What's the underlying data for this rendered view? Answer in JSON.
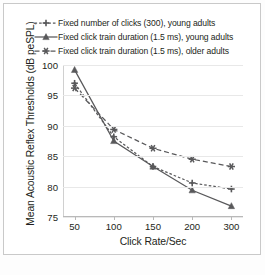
{
  "figure": {
    "background_color": "#ffffff",
    "frame_color": "#c9c9c9"
  },
  "axes": {
    "ytitle": "Mean Acoustic Reflex Thresholds (dB peSPL)",
    "xtitle": "Click Rate/Sec",
    "yticks": [
      "100",
      "95",
      "90",
      "85",
      "80",
      "75"
    ],
    "xticks": [
      "50",
      "100",
      "150",
      "200",
      "300"
    ]
  },
  "legend": {
    "position": "top-left-above-axes",
    "items": [
      {
        "label": "Fixed number of clicks (300), young adults",
        "marker": "plus-star-marker",
        "line_style": "dotted",
        "color": "#59595b"
      },
      {
        "label": "Fixed click train duration (1.5 ms), young adults",
        "marker": "triangle-marker",
        "line_style": "solid",
        "color": "#59595b"
      },
      {
        "label": "Fixed click train duration (1.5 ms), older adults",
        "marker": "asterisk-marker",
        "line_style": "dashed",
        "color": "#59595b"
      }
    ]
  },
  "chart_data": {
    "type": "line",
    "title": "",
    "xlabel": "Click Rate/Sec",
    "ylabel": "Mean Acoustic Reflex Thresholds (dB peSPL)",
    "categories": [
      "50",
      "100",
      "150",
      "200",
      "300"
    ],
    "x": [
      50,
      100,
      150,
      200,
      300
    ],
    "ylim": [
      75,
      100
    ],
    "yticks": [
      75,
      80,
      85,
      90,
      95,
      100
    ],
    "grid": "horizontal",
    "legend_position": "above-plot-left",
    "series": [
      {
        "name": "Fixed number of clicks (300), young adults",
        "values": [
          97.0,
          88.2,
          83.3,
          80.6,
          79.6
        ],
        "line_style": "dotted",
        "marker": "plus-star-marker",
        "color": "#59595b"
      },
      {
        "name": "Fixed click train duration (1.5 ms), young adults",
        "values": [
          99.2,
          87.5,
          83.3,
          79.4,
          76.8
        ],
        "line_style": "solid",
        "marker": "triangle-marker",
        "color": "#59595b"
      },
      {
        "name": "Fixed click train duration (1.5 ms), older adults",
        "values": [
          96.2,
          89.4,
          86.3,
          84.5,
          83.3
        ],
        "line_style": "dashed",
        "marker": "asterisk-marker",
        "color": "#59595b"
      }
    ]
  }
}
